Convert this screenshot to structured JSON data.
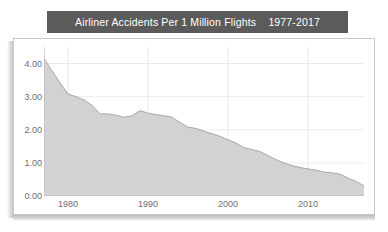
{
  "title": {
    "text": "Airliner Accidents Per 1 Million Flights    1977-2017",
    "main": "Airliner Accidents Per 1 Million Flights",
    "range": "1977-2017",
    "background_color": "#5b5b5b",
    "text_color": "#ffffff"
  },
  "colors": {
    "title_bar": "#5b5b5b",
    "area_fill": "#d2d2d2",
    "area_line": "#a8a8a8",
    "grid": "#ebebeb",
    "axis_line": "#b5b5b5",
    "tick_text": "#6e6e6e",
    "frame_border": "#c8c8c8",
    "plot_background": "#ffffff"
  },
  "axes": {
    "y_ticks": [
      "0.00",
      "1.00",
      "2.00",
      "3.00",
      "4.00"
    ],
    "x_ticks": [
      "1980",
      "1990",
      "2000",
      "2010"
    ]
  },
  "chart_data": {
    "type": "area",
    "title": "Airliner Accidents Per 1 Million Flights    1977-2017",
    "xlabel": "",
    "ylabel": "",
    "xlim": [
      1977,
      2017
    ],
    "ylim": [
      0,
      4.5
    ],
    "grid": true,
    "legend": null,
    "x": [
      1977,
      1978,
      1979,
      1980,
      1981,
      1982,
      1983,
      1984,
      1985,
      1986,
      1987,
      1988,
      1989,
      1990,
      1991,
      1992,
      1993,
      1994,
      1995,
      1996,
      1997,
      1998,
      1999,
      2000,
      2001,
      2002,
      2003,
      2004,
      2005,
      2006,
      2007,
      2008,
      2009,
      2010,
      2011,
      2012,
      2013,
      2014,
      2015,
      2016,
      2017
    ],
    "series": [
      {
        "name": "Accidents per 1 million flights",
        "values": [
          4.15,
          3.78,
          3.42,
          3.08,
          3.0,
          2.9,
          2.74,
          2.48,
          2.48,
          2.44,
          2.38,
          2.42,
          2.58,
          2.5,
          2.46,
          2.42,
          2.38,
          2.22,
          2.08,
          2.04,
          1.96,
          1.88,
          1.8,
          1.7,
          1.6,
          1.46,
          1.4,
          1.34,
          1.22,
          1.1,
          1.0,
          0.92,
          0.86,
          0.82,
          0.78,
          0.72,
          0.7,
          0.66,
          0.54,
          0.44,
          0.31
        ]
      }
    ],
    "y_ticks": [
      0,
      1,
      2,
      3,
      4
    ],
    "y_tick_labels": [
      "0.00",
      "1.00",
      "2.00",
      "3.00",
      "4.00"
    ],
    "x_ticks": [
      1980,
      1990,
      2000,
      2010
    ],
    "x_tick_labels": [
      "1980",
      "1990",
      "2000",
      "2010"
    ]
  }
}
